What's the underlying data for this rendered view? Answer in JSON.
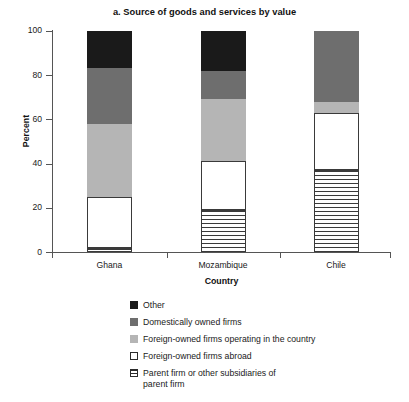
{
  "chart_data": {
    "type": "bar",
    "subtype": "stacked-bar",
    "title": "a. Source of goods and services by value",
    "xlabel": "Country",
    "ylabel": "Percent",
    "categories": [
      "Ghana",
      "Mozambique",
      "Chile"
    ],
    "ylim": [
      0,
      100
    ],
    "yticks": [
      0,
      20,
      40,
      60,
      80,
      100
    ],
    "ytick_labels": [
      "0",
      "20",
      "40",
      "60",
      "80",
      "100"
    ],
    "grid": false,
    "legend_position": "below-right",
    "stack_order": "bottom-to-top",
    "series": [
      {
        "name": "Parent firm or other subsidiaries of parent firm",
        "legend_label": "Parent firm or other subsidiaries of\nparent firm",
        "fill": "hatched",
        "color": "#3a3a3a",
        "values": [
          2,
          19,
          37
        ]
      },
      {
        "name": "Foreign-owned firms abroad",
        "legend_label": "Foreign-owned firms abroad",
        "fill": "outlined",
        "color": "#ffffff",
        "values": [
          23,
          22,
          26
        ]
      },
      {
        "name": "Foreign-owned firms operating in the country",
        "legend_label": "Foreign-owned firms operating in the country",
        "fill": "solid",
        "color": "#b5b5b5",
        "values": [
          33,
          28,
          5
        ]
      },
      {
        "name": "Domestically owned firms",
        "legend_label": "Domestically owned firms",
        "fill": "solid",
        "color": "#6e6e6e",
        "values": [
          25,
          13,
          32
        ]
      },
      {
        "name": "Other",
        "legend_label": "Other",
        "fill": "solid",
        "color": "#1a1a1a",
        "values": [
          17,
          18,
          0
        ]
      }
    ]
  },
  "colors": {
    "other": "#1a1a1a",
    "domestic": "#6e6e6e",
    "foreign_local": "#b5b5b5",
    "foreign_abroad": "#ffffff",
    "parent_firm": "#3a3a3a",
    "axis": "#555555",
    "background": "#ffffff"
  }
}
